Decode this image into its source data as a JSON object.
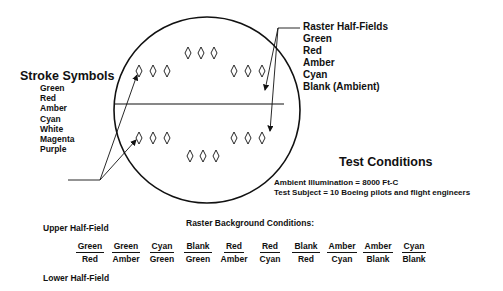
{
  "stroke_symbols": {
    "title": "Stroke Symbols",
    "colors": [
      "Green",
      "Red",
      "Amber",
      "Cyan",
      "White",
      "Magenta",
      "Purple"
    ]
  },
  "raster_half_fields": {
    "title": "Raster Half-Fields",
    "options": [
      "Green",
      "Red",
      "Amber",
      "Cyan",
      "Blank (Ambient)"
    ]
  },
  "test_conditions": {
    "title": "Test Conditions",
    "ambient": "Ambient Illumination = 8000 Ft-C",
    "subjects": "Test Subject = 10 Boeing pilots and flight engineers"
  },
  "raster_background": {
    "title": "Raster Background Conditions:",
    "upper_label": "Upper Half-Field",
    "lower_label": "Lower Half-Field",
    "pairs": [
      {
        "upper": "Green",
        "lower": "Red"
      },
      {
        "upper": "Green",
        "lower": "Amber"
      },
      {
        "upper": "Cyan",
        "lower": "Green"
      },
      {
        "upper": "Blank",
        "lower": "Green"
      },
      {
        "upper": "Red",
        "lower": "Amber"
      },
      {
        "upper": "Red",
        "lower": "Cyan"
      },
      {
        "upper": "Blank",
        "lower": "Red"
      },
      {
        "upper": "Amber",
        "lower": "Cyan"
      },
      {
        "upper": "Amber",
        "lower": "Blank"
      },
      {
        "upper": "Cyan",
        "lower": "Blank"
      }
    ]
  },
  "display": {
    "shape": "circle",
    "divider": "horizontal",
    "symbol": "diamond",
    "symbol_groups": 6,
    "symbols_per_group": 3
  }
}
